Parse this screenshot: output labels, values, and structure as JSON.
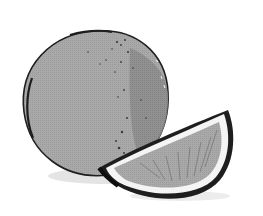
{
  "image": {
    "subject": "Orange with wedge slice",
    "style": "grayscale halftone illustration",
    "elements": [
      "whole-orange",
      "orange-wedge",
      "cast-shadow"
    ],
    "colors": {
      "background": "#ffffff",
      "peel_light": "#a8a8a8",
      "peel_shade": "#8c8c8c",
      "outline": "#1e1e1e",
      "pith": "#f4f4f4",
      "flesh": "#9a9a9a",
      "shadow": "#e2e2e2"
    }
  }
}
